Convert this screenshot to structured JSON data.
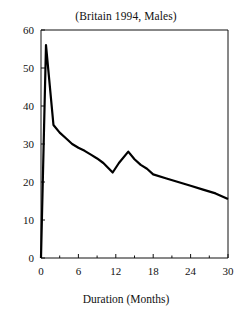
{
  "chart_data": {
    "type": "line",
    "title": "(Britain 1994, Males)",
    "xlabel": "Duration (Months)",
    "ylabel": "",
    "xlim": [
      0,
      30
    ],
    "ylim": [
      0,
      60
    ],
    "grid": false,
    "legend": "none",
    "xticks": [
      "0",
      "6",
      "12",
      "18",
      "24",
      "30"
    ],
    "xtick_values": [
      0,
      6,
      12,
      18,
      24,
      30
    ],
    "yticks": [
      "0",
      "10",
      "20",
      "30",
      "40",
      "50",
      "60"
    ],
    "ytick_values": [
      0,
      10,
      20,
      30,
      40,
      50,
      60
    ],
    "minor_xtick_values": [
      3,
      9,
      15,
      21,
      27
    ],
    "series": [
      {
        "name": "Exit rate",
        "x": [
          0,
          0.8,
          2,
          3,
          4,
          5,
          6,
          7,
          8,
          9,
          10,
          11.5,
          12.5,
          14,
          15,
          16,
          17,
          18,
          20,
          22,
          24,
          26,
          28,
          30
        ],
        "values": [
          0,
          56,
          35,
          33,
          31.5,
          30,
          29,
          28.2,
          27.2,
          26.2,
          25,
          22.5,
          25,
          28,
          26,
          24.5,
          23.5,
          22,
          21,
          20,
          19,
          18,
          17,
          15.5
        ]
      }
    ],
    "annotations": []
  },
  "figure": {
    "background_color": "#ffffff",
    "line_color": "#000000",
    "axis_color": "#111111"
  }
}
